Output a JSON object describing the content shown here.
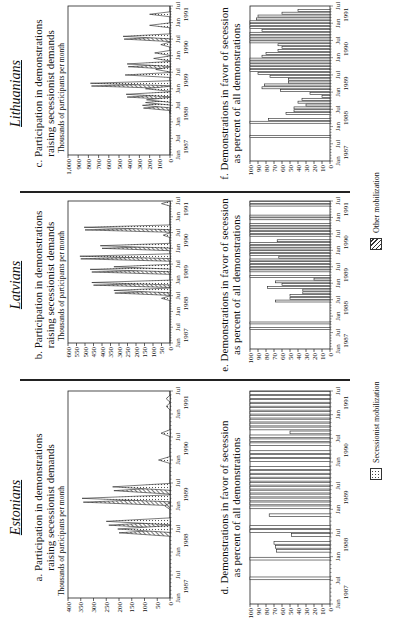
{
  "panels": [
    {
      "country": "Estonians",
      "top_title": [
        "a. Participation in demonstrations",
        "raising secessionist demands"
      ],
      "bottom_title": [
        "d. Demonstrations in favor of secession",
        "as percent of all demonstrations"
      ]
    },
    {
      "country": "Latvians",
      "top_title": [
        "b. Participation in demonstrations",
        "raising secessionist demands"
      ],
      "bottom_title": [
        "e. Demonstrations in favor of secession",
        "as percent of all demonstrations"
      ]
    },
    {
      "country": "Lithuanians",
      "top_title": [
        "c. Participation in demonstrations",
        "raising secessionist demands"
      ],
      "bottom_title": [
        "f. Demonstrations in favor of secession",
        "as percent of all demonstrations"
      ]
    }
  ],
  "legend": {
    "secessionist": "Secessionist mobilization",
    "other": "Other mobilization"
  },
  "chart_data": [
    {
      "type": "area",
      "title": "a. Participation in demonstrations raising secessionist demands",
      "ylabel": "Thousands of participants per month",
      "ylim": [
        0,
        400
      ],
      "yticks": [
        0,
        50,
        100,
        150,
        200,
        250,
        300,
        350,
        400
      ],
      "xticks": [
        "Jan",
        "Jul",
        "Jan",
        "Jul",
        "Jan",
        "Jul",
        "Jan",
        "Jul",
        "Jan",
        "Jul"
      ],
      "xyears": [
        "1987",
        "1988",
        "1989",
        "1990",
        "1991"
      ],
      "x_months": 54,
      "series": [
        {
          "name": "Secessionist mobilization",
          "peaks": [
            [
              18,
              205
            ],
            [
              20,
              250
            ],
            [
              26,
              345
            ],
            [
              29,
              225
            ],
            [
              36,
              45
            ],
            [
              43,
              35
            ],
            [
              50,
              15
            ],
            [
              52,
              15
            ]
          ]
        },
        {
          "name": "Other mobilization",
          "peaks": [
            [
              17,
              200
            ],
            [
              19,
              240
            ],
            [
              25,
              340
            ],
            [
              28,
              220
            ],
            [
              24,
              20
            ]
          ]
        }
      ]
    },
    {
      "type": "area",
      "title": "b. Participation in demonstrations raising secessionist demands",
      "ylabel": "Thousands of participants per month",
      "ylim": [
        0,
        600
      ],
      "yticks": [
        0,
        50,
        100,
        150,
        200,
        250,
        300,
        350,
        400,
        450,
        500,
        550,
        600
      ],
      "xticks": [
        "Jan",
        "Jul",
        "Jan",
        "Jul",
        "Jan",
        "Jul",
        "Jan",
        "Jul",
        "Jan",
        "Jul"
      ],
      "xyears": [
        "1987",
        "1988",
        "1989",
        "1990",
        "1991"
      ],
      "x_months": 54,
      "series": [
        {
          "name": "Secessionist mobilization",
          "peaks": [
            [
              17,
              50
            ],
            [
              20,
              330
            ],
            [
              23,
              460
            ],
            [
              28,
              470
            ],
            [
              29,
              330
            ],
            [
              33,
              530
            ],
            [
              37,
              410
            ],
            [
              41,
              40
            ],
            [
              44,
              505
            ],
            [
              53,
              50
            ]
          ]
        },
        {
          "name": "Other mobilization",
          "peaks": [
            [
              19,
              325
            ],
            [
              22,
              450
            ],
            [
              27,
              460
            ],
            [
              32,
              525
            ],
            [
              36,
              400
            ],
            [
              43,
              500
            ]
          ]
        }
      ]
    },
    {
      "type": "area",
      "title": "c. Participation in demonstrations raising secessionist demands",
      "ylabel": "Thousands of participants per month",
      "ylim": [
        0,
        1000
      ],
      "yticks": [
        0,
        100,
        200,
        300,
        400,
        500,
        600,
        700,
        800,
        900,
        1000
      ],
      "ytick_labels": [
        "0",
        "100",
        "200",
        "300",
        "400",
        "500",
        "600",
        "700",
        "800",
        "900",
        "1,000"
      ],
      "xticks": [
        "Jan",
        "Jul",
        "Jan",
        "Jul",
        "Jan",
        "Jul",
        "Jan",
        "Jul",
        "Jan",
        "Jul"
      ],
      "xyears": [
        "1987",
        "1988",
        "1989",
        "1990",
        "1991"
      ],
      "x_months": 54,
      "series": [
        {
          "name": "Secessionist mobilization",
          "peaks": [
            [
              16,
              5
            ],
            [
              18,
              270
            ],
            [
              19,
              240
            ],
            [
              20,
              230
            ],
            [
              22,
              430
            ],
            [
              24,
              240
            ],
            [
              26,
              780
            ],
            [
              29,
              440
            ],
            [
              31,
              140
            ],
            [
              33,
              420
            ],
            [
              35,
              160
            ],
            [
              37,
              150
            ],
            [
              40,
              90
            ],
            [
              43,
              460
            ],
            [
              47,
              200
            ],
            [
              51,
              200
            ]
          ]
        },
        {
          "name": "Other mobilization",
          "peaks": [
            [
              17,
              260
            ],
            [
              21,
              420
            ],
            [
              25,
              770
            ],
            [
              32,
              410
            ],
            [
              42,
              450
            ]
          ]
        }
      ]
    },
    {
      "type": "bar",
      "title": "d. Demonstrations in favor of secession as percent of all demonstrations",
      "ylim": [
        0,
        100
      ],
      "yticks": [
        0,
        10,
        20,
        30,
        40,
        50,
        60,
        70,
        80,
        90,
        100
      ],
      "xticks": [
        "Jan",
        "Jul",
        "Jan",
        "Jul",
        "Jan",
        "Jul",
        "Jan",
        "Jul",
        "Jan",
        "Jul"
      ],
      "xyears": [
        "1987",
        "1988",
        "1989",
        "1990",
        "1991"
      ],
      "x_months": 54,
      "months": [
        6,
        11,
        13,
        14,
        15,
        17,
        18,
        19,
        22,
        24,
        25,
        26,
        27,
        28,
        29,
        30,
        31,
        32,
        33,
        34,
        36,
        37,
        38,
        40,
        41,
        42,
        43,
        44,
        45,
        46,
        47,
        48,
        49,
        50,
        51,
        52,
        53
      ],
      "values": [
        100,
        100,
        67,
        68,
        70,
        48,
        100,
        100,
        76,
        100,
        100,
        100,
        100,
        100,
        100,
        100,
        100,
        100,
        100,
        100,
        100,
        100,
        100,
        100,
        100,
        100,
        50,
        100,
        100,
        100,
        100,
        100,
        100,
        100,
        100,
        100,
        100
      ]
    },
    {
      "type": "bar",
      "title": "e. Demonstrations in favor of secession as percent of all demonstrations",
      "ylim": [
        0,
        100
      ],
      "yticks": [
        0,
        10,
        20,
        30,
        40,
        50,
        60,
        70,
        80,
        90,
        100
      ],
      "xticks": [
        "Jan",
        "Jul",
        "Jan",
        "Jul",
        "Jan",
        "Jul",
        "Jan",
        "Jul",
        "Jan",
        "Jul"
      ],
      "xyears": [
        "1987",
        "1988",
        "1989",
        "1990",
        "1991"
      ],
      "x_months": 54,
      "months": [
        7,
        9,
        17,
        18,
        19,
        20,
        21,
        22,
        23,
        24,
        25,
        26,
        28,
        29,
        30,
        31,
        32,
        33,
        34,
        35,
        36,
        37,
        38,
        39,
        41,
        42,
        43,
        44,
        45,
        47,
        48,
        52,
        53
      ],
      "values": [
        100,
        100,
        68,
        50,
        50,
        34,
        34,
        78,
        60,
        68,
        20,
        100,
        100,
        100,
        100,
        100,
        100,
        64,
        100,
        100,
        100,
        100,
        100,
        66,
        100,
        100,
        100,
        100,
        100,
        100,
        100,
        100,
        100
      ]
    },
    {
      "type": "bar",
      "title": "f. Demonstrations in favor of secession as percent of all demonstrations",
      "ylim": [
        0,
        100
      ],
      "yticks": [
        0,
        10,
        20,
        30,
        40,
        50,
        60,
        70,
        80,
        90,
        100
      ],
      "xticks": [
        "Jan",
        "Jul",
        "Jan",
        "Jul",
        "Jan",
        "Jul",
        "Jan",
        "Jul",
        "Jan",
        "Jul"
      ],
      "xyears": [
        "1987",
        "1988",
        "1989",
        "1990",
        "1991"
      ],
      "x_months": 54,
      "months": [
        8,
        13,
        14,
        16,
        17,
        18,
        19,
        20,
        21,
        22,
        23,
        24,
        25,
        26,
        27,
        28,
        29,
        30,
        31,
        32,
        33,
        34,
        35,
        36,
        37,
        38,
        39,
        40,
        41,
        42,
        43,
        44,
        45,
        46,
        47,
        48,
        49,
        50,
        51,
        52
      ],
      "values": [
        100,
        100,
        77,
        55,
        45,
        45,
        30,
        40,
        35,
        10,
        25,
        62,
        85,
        82,
        52,
        52,
        75,
        90,
        100,
        100,
        100,
        100,
        100,
        85,
        80,
        65,
        60,
        65,
        100,
        100,
        100,
        100,
        85,
        100,
        100,
        100,
        92,
        90,
        60,
        40
      ]
    }
  ]
}
